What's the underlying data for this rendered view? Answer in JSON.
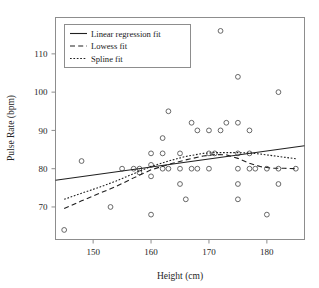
{
  "chart_data": {
    "type": "scatter",
    "title": "",
    "xlabel": "Height (cm)",
    "ylabel": "Pulse Rate (bpm)",
    "xlim": [
      143.5,
      186.5
    ],
    "ylim": [
      61.5,
      119.5
    ],
    "xticks": [
      150,
      160,
      170,
      180
    ],
    "yticks": [
      70,
      80,
      90,
      100,
      110
    ],
    "xticklabels": [
      "150",
      "160",
      "170",
      "180"
    ],
    "yticklabels": [
      "70",
      "80",
      "90",
      "100",
      "110"
    ],
    "grid": false,
    "legend_position": "upper left",
    "marker": "open-circle",
    "points": [
      [
        145,
        64
      ],
      [
        148,
        82
      ],
      [
        153,
        70
      ],
      [
        155,
        80
      ],
      [
        157,
        80
      ],
      [
        158,
        80
      ],
      [
        158,
        79
      ],
      [
        160,
        84
      ],
      [
        160,
        81
      ],
      [
        160,
        78
      ],
      [
        160,
        68
      ],
      [
        162,
        84
      ],
      [
        162,
        88
      ],
      [
        162,
        80
      ],
      [
        163,
        95
      ],
      [
        163,
        80
      ],
      [
        165,
        84
      ],
      [
        165,
        80
      ],
      [
        165,
        76
      ],
      [
        166,
        72
      ],
      [
        167,
        92
      ],
      [
        167,
        80
      ],
      [
        168,
        90
      ],
      [
        168,
        80
      ],
      [
        170,
        90
      ],
      [
        170,
        84
      ],
      [
        170,
        80
      ],
      [
        171,
        84
      ],
      [
        172,
        116
      ],
      [
        172,
        90
      ],
      [
        173,
        92
      ],
      [
        175,
        104
      ],
      [
        175,
        92
      ],
      [
        175,
        84
      ],
      [
        175,
        80
      ],
      [
        175,
        76
      ],
      [
        175,
        72
      ],
      [
        177,
        90
      ],
      [
        177,
        84
      ],
      [
        177,
        80
      ],
      [
        178,
        80
      ],
      [
        180,
        80
      ],
      [
        180,
        68
      ],
      [
        182,
        100
      ],
      [
        182,
        80
      ],
      [
        182,
        76
      ],
      [
        185,
        80
      ]
    ],
    "series": [
      {
        "name": "Linear regression fit",
        "style": "solid",
        "type": "line",
        "points": [
          [
            143.5,
            77.0
          ],
          [
            186.5,
            86.0
          ]
        ]
      },
      {
        "name": "Lowess fit",
        "style": "dashed",
        "type": "line",
        "points": [
          [
            145.0,
            69.6
          ],
          [
            148.0,
            71.6
          ],
          [
            151.0,
            73.5
          ],
          [
            154.0,
            75.4
          ],
          [
            157.0,
            77.6
          ],
          [
            160.0,
            79.7
          ],
          [
            163.0,
            81.1
          ],
          [
            166.0,
            82.3
          ],
          [
            169.0,
            83.3
          ],
          [
            171.0,
            83.7
          ],
          [
            173.0,
            83.6
          ],
          [
            175.0,
            82.7
          ],
          [
            177.0,
            81.4
          ],
          [
            179.0,
            80.5
          ],
          [
            181.0,
            80.1
          ],
          [
            183.0,
            80.1
          ],
          [
            185.0,
            80.0
          ]
        ]
      },
      {
        "name": "Spline fit",
        "style": "dotted",
        "type": "line",
        "points": [
          [
            145.0,
            72.0
          ],
          [
            148.0,
            73.6
          ],
          [
            151.0,
            75.1
          ],
          [
            154.0,
            76.8
          ],
          [
            157.0,
            78.7
          ],
          [
            160.0,
            80.6
          ],
          [
            163.0,
            82.0
          ],
          [
            166.0,
            83.2
          ],
          [
            169.0,
            84.0
          ],
          [
            171.0,
            84.2
          ],
          [
            173.0,
            84.2
          ],
          [
            175.0,
            84.2
          ],
          [
            177.0,
            84.1
          ],
          [
            179.0,
            83.8
          ],
          [
            181.0,
            83.4
          ],
          [
            183.0,
            83.0
          ],
          [
            185.0,
            82.6
          ]
        ]
      }
    ]
  },
  "legend": {
    "items": [
      {
        "label": "Linear regression fit",
        "style": "solid"
      },
      {
        "label": "Lowess fit",
        "style": "dashed"
      },
      {
        "label": "Spline fit",
        "style": "dotted"
      }
    ]
  },
  "colors": {
    "line": "#202020",
    "marker": "#585858",
    "frame": "#8d8d8d",
    "background": "#ffffff",
    "text": "#1a1a1a"
  }
}
